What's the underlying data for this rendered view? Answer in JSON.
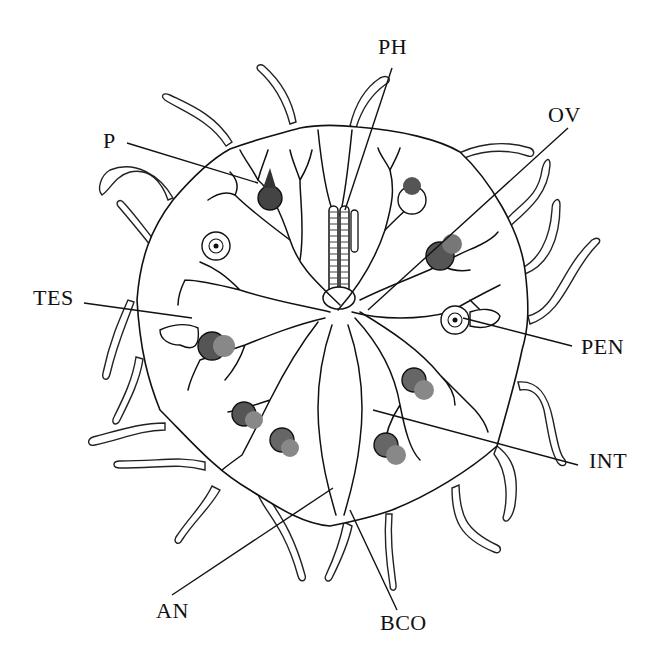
{
  "figure": {
    "type": "anatomical line illustration",
    "background": "#ffffff",
    "ink": "#111111"
  },
  "labels": [
    {
      "id": "PH",
      "text": "PH",
      "x": 378,
      "y": 50,
      "line": [
        [
          392,
          68
        ],
        [
          345,
          210
        ]
      ]
    },
    {
      "id": "P",
      "text": "P",
      "x": 103,
      "y": 128,
      "line": [
        [
          127,
          143
        ],
        [
          258,
          183
        ]
      ]
    },
    {
      "id": "OV",
      "text": "OV",
      "x": 548,
      "y": 104,
      "line": [
        [
          568,
          128
        ],
        [
          368,
          310
        ]
      ]
    },
    {
      "id": "TES",
      "text": "TES",
      "x": 33,
      "y": 287,
      "line": [
        [
          84,
          303
        ],
        [
          192,
          318
        ]
      ]
    },
    {
      "id": "PEN",
      "text": "PEN",
      "x": 581,
      "y": 342,
      "line": [
        [
          572,
          346
        ],
        [
          463,
          318
        ]
      ]
    },
    {
      "id": "INT",
      "text": "INT",
      "x": 589,
      "y": 459,
      "line": [
        [
          578,
          465
        ],
        [
          373,
          410
        ]
      ]
    },
    {
      "id": "AN",
      "text": "AN",
      "x": 156,
      "y": 605,
      "line": [
        [
          172,
          595
        ],
        [
          333,
          488
        ]
      ]
    },
    {
      "id": "BCO",
      "text": "BCO",
      "x": 380,
      "y": 615,
      "line": [
        [
          397,
          610
        ],
        [
          350,
          510
        ]
      ]
    }
  ]
}
